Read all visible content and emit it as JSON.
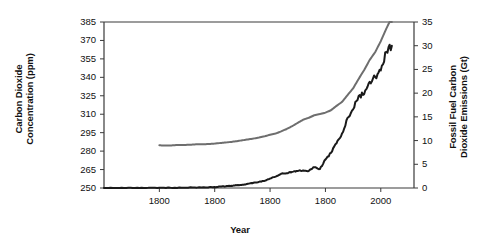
{
  "chart_data": {
    "type": "line",
    "title": "",
    "xlabel": "Year",
    "ylabel": "Carbon Dioxide Concentration (ppm)",
    "y2label": "Fossil Fuel Carbon Dioxide Emissions (Gt)",
    "grid": false,
    "legend": "none",
    "xlim": [
      1750,
      2030
    ],
    "xticks": [
      1800,
      1850,
      1900,
      1950,
      2000
    ],
    "xticklabels": [
      "1800",
      "1800",
      "1800",
      "1800",
      "2000"
    ],
    "ylim": [
      250,
      385
    ],
    "yticks": [
      250,
      265,
      280,
      295,
      310,
      325,
      340,
      355,
      370,
      385
    ],
    "yticklabels": [
      "385",
      "370",
      "355",
      "340",
      "325",
      "310",
      "295",
      "280",
      "265",
      "250"
    ],
    "y2lim": [
      0,
      35
    ],
    "y2ticks": [
      0,
      5,
      10,
      15,
      20,
      25,
      30,
      35
    ],
    "y2ticklabels": [
      "35",
      "30",
      "25",
      "20",
      "15",
      "10",
      "5",
      "0"
    ],
    "series": [
      {
        "name": "Carbon Dioxide Concentration",
        "axis": "left",
        "color": "#6e6e6e",
        "width": 2,
        "x": [
          1800,
          1805,
          1810,
          1815,
          1820,
          1825,
          1830,
          1835,
          1840,
          1845,
          1850,
          1855,
          1860,
          1865,
          1870,
          1875,
          1880,
          1885,
          1890,
          1895,
          1900,
          1905,
          1910,
          1915,
          1920,
          1925,
          1930,
          1935,
          1940,
          1945,
          1950,
          1955,
          1960,
          1965,
          1970,
          1975,
          1980,
          1985,
          1990,
          1995,
          2000,
          2005,
          2010
        ],
        "y": [
          284.7,
          284.6,
          284.6,
          284.9,
          284.9,
          285.1,
          285.3,
          285.6,
          285.6,
          285.8,
          286.1,
          286.6,
          287.0,
          287.5,
          288.1,
          288.8,
          289.5,
          290.2,
          291.0,
          292.0,
          293.3,
          294.3,
          296.0,
          298.0,
          300.3,
          303.0,
          305.6,
          307.1,
          309.2,
          310.1,
          311.3,
          313.2,
          316.8,
          320.0,
          325.6,
          331.0,
          338.7,
          346.0,
          354.2,
          360.6,
          369.4,
          379.6,
          389.0
        ]
      },
      {
        "name": "Fossil Fuel Carbon Dioxide Emissions",
        "axis": "right",
        "color": "#1a1a1a",
        "width": 2,
        "x": [
          1750,
          1760,
          1770,
          1780,
          1790,
          1800,
          1810,
          1820,
          1830,
          1840,
          1850,
          1855,
          1860,
          1865,
          1870,
          1875,
          1880,
          1885,
          1890,
          1895,
          1900,
          1905,
          1910,
          1915,
          1920,
          1925,
          1930,
          1935,
          1940,
          1945,
          1950,
          1955,
          1960,
          1965,
          1970,
          1975,
          1980,
          1985,
          1990,
          1995,
          2000,
          2005,
          2010
        ],
        "y": [
          0.01,
          0.01,
          0.02,
          0.03,
          0.03,
          0.05,
          0.05,
          0.07,
          0.1,
          0.15,
          0.2,
          0.3,
          0.35,
          0.45,
          0.6,
          0.7,
          0.9,
          1.1,
          1.3,
          1.5,
          2.0,
          2.4,
          3.0,
          3.1,
          3.4,
          3.6,
          3.7,
          3.6,
          4.4,
          4.0,
          6.0,
          7.4,
          9.4,
          11.5,
          14.8,
          16.6,
          19.4,
          19.8,
          22.4,
          23.4,
          24.8,
          28.7,
          30.0
        ]
      }
    ],
    "emissions_noise_note": "black emissions line is jagged year-to-year",
    "colors": {
      "co2_line": "#6e6e6e",
      "emissions_line": "#1a1a1a",
      "axis": "#3a3a3a",
      "background": "#ffffff"
    }
  },
  "axes": {
    "left_title_line1": "Carbon Dioxide",
    "left_title_line2": "Concentration (ppm)",
    "right_title_line1": "Fossil Fuel Carbon",
    "right_title_line2": "Dioxide Emissions (Gt)",
    "x_title": "Year"
  }
}
